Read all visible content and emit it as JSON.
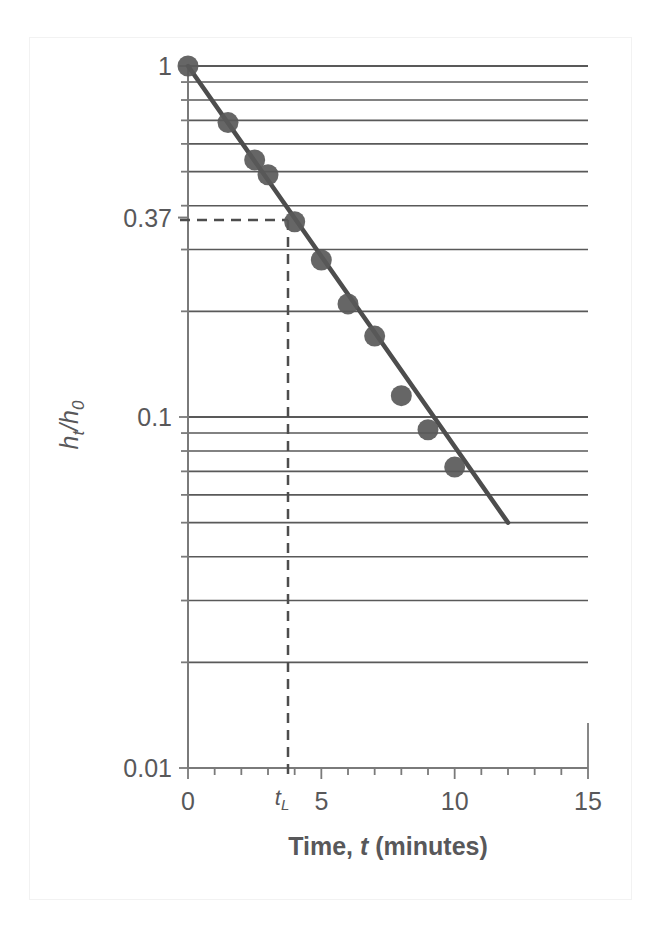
{
  "chart_data": {
    "type": "scatter",
    "title": "",
    "xlabel": "Time, t (minutes)",
    "ylabel": "h_t/h_0",
    "yscale": "log",
    "xscale": "linear",
    "xlim": [
      0,
      15
    ],
    "ylim": [
      0.01,
      1
    ],
    "grid": "horizontal log minor gridlines",
    "legend": "none",
    "x": [
      0,
      1.5,
      2.5,
      3,
      4,
      5,
      6,
      7,
      8,
      9,
      10
    ],
    "values": [
      1.0,
      0.69,
      0.54,
      0.49,
      0.36,
      0.28,
      0.21,
      0.17,
      0.115,
      0.092,
      0.072
    ],
    "series": [
      {
        "name": "h_t/h_0 measured",
        "marker": "filled circle",
        "color": "#595959",
        "values": [
          1.0,
          0.69,
          0.54,
          0.49,
          0.36,
          0.28,
          0.21,
          0.17,
          0.115,
          0.092,
          0.072
        ]
      },
      {
        "name": "fitted exponential trend line",
        "type": "line",
        "color": "#4d4d4d",
        "x_range": [
          0,
          12
        ],
        "y_range": [
          1.0,
          0.05
        ]
      }
    ],
    "annotations": [
      {
        "name": "decay-constant-marker",
        "label": "t_L",
        "x": 4,
        "y": 0.37,
        "style": "dashed leader lines to both axes"
      },
      {
        "name": "y-value-0.37",
        "label": "0.37",
        "y": 0.37
      }
    ],
    "xticks_major": [
      0,
      5,
      10,
      15
    ],
    "xtick_labels": [
      "0",
      "5",
      "10",
      "15"
    ],
    "xticks_minor_step": 1,
    "yticks_labeled": [
      1,
      0.37,
      0.1,
      0.01
    ],
    "ytick_labels": [
      "1",
      "0.37",
      "0.1",
      "0.01"
    ],
    "ygrid_values": [
      1,
      0.9,
      0.8,
      0.7,
      0.6,
      0.5,
      0.4,
      0.3,
      0.2,
      0.1,
      0.09,
      0.08,
      0.07,
      0.06,
      0.05,
      0.04,
      0.03,
      0.02,
      0.01
    ]
  },
  "axis": {
    "y_title": "h",
    "y_title_sub1": "t",
    "y_title_slash": "/h",
    "y_title_sub2": "0",
    "x_title_prefix": "Time, ",
    "x_title_italic": "t",
    "x_title_suffix": " (minutes)",
    "y_label_top": "1",
    "y_label_mid": "0.37",
    "y_label_tenth": "0.1",
    "y_label_bottom": "0.01",
    "x_label_0": "0",
    "x_label_5": "5",
    "x_label_10": "10",
    "x_label_15": "15",
    "tl_label": "t",
    "tl_sub": "L"
  },
  "colors": {
    "marker": "#595959",
    "trendline": "#4d4d4d",
    "gridline": "#595959",
    "axis": "#7a7a7a",
    "text": "#58585a",
    "frame": "#f2f2f2",
    "background": "#ffffff"
  }
}
